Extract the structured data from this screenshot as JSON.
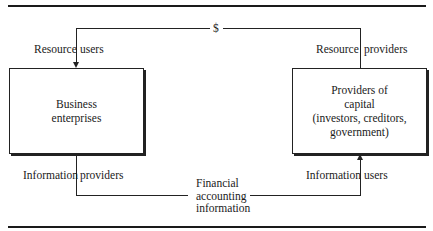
{
  "diagram": {
    "money_symbol": "$",
    "left_node": {
      "lines": [
        "Business",
        "enterprises"
      ],
      "top_label": {
        "left": "Resource",
        "right": "users"
      },
      "bottom_label": {
        "left": "Information",
        "right": "providers"
      }
    },
    "right_node": {
      "lines": [
        "Providers of",
        "capital",
        "(investors, creditors,",
        "government)"
      ],
      "top_label": {
        "left": "Resource",
        "right": "providers"
      },
      "bottom_label": {
        "left": "Information",
        "right": "users"
      }
    },
    "flow_label": {
      "lines": [
        "Financial",
        "accounting",
        "information"
      ]
    },
    "edges": [
      {
        "from": "right_node",
        "to": "left_node",
        "via": "$",
        "meaning": "capital flow"
      },
      {
        "from": "left_node",
        "to": "right_node",
        "via": "Financial accounting information",
        "meaning": "information flow"
      }
    ]
  }
}
